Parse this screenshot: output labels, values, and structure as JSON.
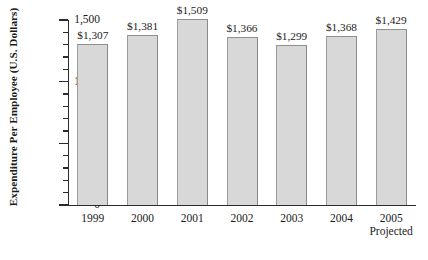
{
  "chart_data": {
    "type": "bar",
    "title": "",
    "subtitle": "",
    "xlabel": "",
    "ylabel": "Expenditure Per Employee (U.S. Dollars)",
    "categories": [
      "1999",
      "2000",
      "2001",
      "2002",
      "2003",
      "2004",
      "2005"
    ],
    "category_notes": [
      "",
      "",
      "",
      "",
      "",
      "",
      "Projected"
    ],
    "values": [
      1307,
      1381,
      1509,
      1366,
      1299,
      1368,
      1429
    ],
    "data_labels": [
      "$1,307",
      "$1,381",
      "$1,509",
      "$1,366",
      "$1,299",
      "$1,368",
      "$1,429"
    ],
    "ylim": [
      0,
      1500
    ],
    "y_major_ticks": [
      0,
      500,
      1000,
      1500
    ],
    "y_major_tick_labels": [
      "0",
      "500",
      "1,000",
      "1,500"
    ],
    "y_minor_tick_interval": 100,
    "grid": false,
    "legend": null,
    "bar_fill_color": "#d8d8d8",
    "bar_edge_color": "#8a8a8a",
    "axis_color": "#2b2b2b",
    "text_color": "#1a1a1a",
    "background_color": "#ffffff"
  }
}
